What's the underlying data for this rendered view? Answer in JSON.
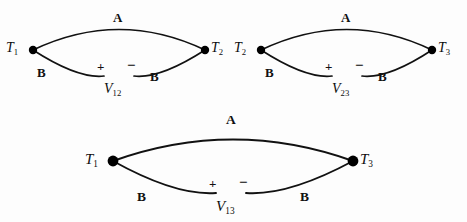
{
  "figure": {
    "type": "thermocouple-loop-diagram",
    "background_color": "#fdfdfd",
    "line_color": "#111111",
    "node_color": "#000000",
    "loops": [
      {
        "id": "loop-12",
        "upper_conductor": "A",
        "lower_conductor_left": "B",
        "lower_conductor_right": "B",
        "left_node_label": "T",
        "left_node_subscript": "1",
        "right_node_label": "T",
        "right_node_subscript": "2",
        "voltage_label": "V",
        "voltage_subscript": "12",
        "plus_sign": "+",
        "minus_sign": "−"
      },
      {
        "id": "loop-23",
        "upper_conductor": "A",
        "lower_conductor_left": "B",
        "lower_conductor_right": "B",
        "left_node_label": "T",
        "left_node_subscript": "2",
        "right_node_label": "T",
        "right_node_subscript": "3",
        "voltage_label": "V",
        "voltage_subscript": "23",
        "plus_sign": "+",
        "minus_sign": "−"
      },
      {
        "id": "loop-13",
        "upper_conductor": "A",
        "lower_conductor_left": "B",
        "lower_conductor_right": "B",
        "left_node_label": "T",
        "left_node_subscript": "1",
        "right_node_label": "T",
        "right_node_subscript": "3",
        "voltage_label": "V",
        "voltage_subscript": "13",
        "plus_sign": "+",
        "minus_sign": "−"
      }
    ]
  }
}
